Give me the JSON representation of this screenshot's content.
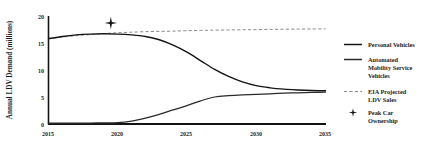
{
  "chart_data": {
    "type": "line",
    "title": "",
    "xlabel": "",
    "ylabel": "Annual LDV Demand (millions)",
    "xlim": [
      2015,
      2035
    ],
    "ylim": [
      0,
      20
    ],
    "grid": false,
    "legend_position": "right",
    "x_ticks": [
      "2015",
      "2020",
      "2025",
      "2030",
      "2035"
    ],
    "y_ticks": [
      "0",
      "5",
      "10",
      "15",
      "20"
    ],
    "x": [
      2015,
      2016,
      2017,
      2018,
      2019,
      2020,
      2021,
      2022,
      2023,
      2024,
      2025,
      2026,
      2027,
      2028,
      2029,
      2030,
      2031,
      2032,
      2033,
      2034,
      2035
    ],
    "series": [
      {
        "name": "Personal Vehicles",
        "style": "solid",
        "color": "#141414",
        "values": [
          15.8,
          16.2,
          16.5,
          16.65,
          16.7,
          16.65,
          16.5,
          16.2,
          15.6,
          14.6,
          13.3,
          11.7,
          10.1,
          8.8,
          7.8,
          7.1,
          6.7,
          6.45,
          6.3,
          6.2,
          6.15
        ]
      },
      {
        "name": "Automated Mobility Service Vehicles",
        "style": "solid",
        "color": "#2a2a2a",
        "values": [
          0.15,
          0.16,
          0.17,
          0.18,
          0.2,
          0.25,
          0.55,
          1.1,
          1.8,
          2.6,
          3.4,
          4.3,
          5.0,
          5.25,
          5.4,
          5.5,
          5.6,
          5.7,
          5.78,
          5.85,
          5.9
        ]
      },
      {
        "name": "EIA Projected LDV Sales",
        "style": "dashed",
        "color": "#8c8c8c",
        "values": [
          15.8,
          16.1,
          16.35,
          16.55,
          16.75,
          16.9,
          17.0,
          17.1,
          17.15,
          17.2,
          17.28,
          17.33,
          17.38,
          17.42,
          17.45,
          17.48,
          17.52,
          17.55,
          17.58,
          17.6,
          17.62
        ]
      }
    ],
    "annotations": [
      {
        "name": "Peak Car Ownership",
        "marker": "four-pointed-star",
        "x": 2019.5,
        "y": 18.7,
        "color": "#141414"
      }
    ]
  },
  "legend": {
    "items": [
      {
        "label": "Personal Vehicles",
        "label_lines": [
          "Personal Vehicles"
        ],
        "marker": "solid-line",
        "color": "#141414"
      },
      {
        "label": "Automated Mobility Service Vehicles",
        "label_lines": [
          "Automated",
          "Mobility Service",
          "Vehicles"
        ],
        "marker": "solid-line",
        "color": "#2a2a2a"
      },
      {
        "label": "EIA Projected LDV Sales",
        "label_lines": [
          "EIA Projected",
          "LDV Sales"
        ],
        "marker": "dashed-line",
        "color": "#8c8c8c"
      },
      {
        "label": "Peak Car Ownership",
        "label_lines": [
          "Peak Car",
          "Ownership"
        ],
        "marker": "four-pointed-star",
        "color": "#141414"
      }
    ]
  }
}
